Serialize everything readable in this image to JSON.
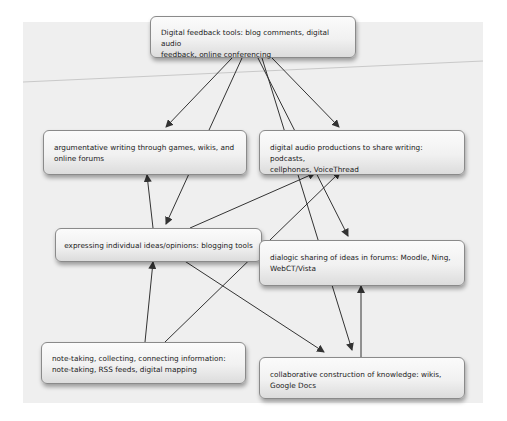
{
  "diagram": {
    "background_color": "#efefef",
    "node_border_color": "#8a8a8a",
    "edge_color": "#333333",
    "nodes": [
      {
        "id": "feedback",
        "label": "Digital feedback tools: blog comments, digital audio feedback, online conferencing",
        "line1": "Digital feedback tools: blog comments, digital audio",
        "line2": "feedback, online conferencing"
      },
      {
        "id": "argumentative",
        "label": "argumentative writing through games, wikis, and online forums",
        "line1": "argumentative writing through games, wikis, and",
        "line2": "online forums"
      },
      {
        "id": "audio",
        "label": "digital audio productions to share writing: podcasts, cellphones, VoiceThread",
        "line1": "digital audio productions to share writing: podcasts,",
        "line2": "cellphones, VoiceThread"
      },
      {
        "id": "blogging",
        "label": "expressing individual ideas/opinions: blogging tools",
        "line1": "expressing individual ideas/opinions: blogging tools"
      },
      {
        "id": "forums",
        "label": "dialogic sharing of ideas in forums: Moodle, Ning, WebCT/Vista",
        "line1": "dialogic sharing of ideas in forums: Moodle, Ning,",
        "line2": "WebCT/Vista"
      },
      {
        "id": "notetaking",
        "label": "note-taking, collecting, connecting information: note-taking, RSS feeds, digital mapping",
        "line1": "note-taking, collecting, connecting information:",
        "line2": "note-taking, RSS feeds, digital mapping"
      },
      {
        "id": "collaborative",
        "label": "collaborative construction of knowledge: wikis, Google Docs",
        "line1": "collaborative construction of knowledge: wikis,",
        "line2": "Google Docs"
      }
    ],
    "edges": [
      {
        "from": "feedback",
        "to": "argumentative",
        "arrow": true
      },
      {
        "from": "feedback",
        "to": "blogging",
        "arrow": true
      },
      {
        "from": "feedback",
        "to": "forums",
        "arrow": true
      },
      {
        "from": "feedback",
        "to": "collaborative",
        "arrow": true
      },
      {
        "from": "feedback",
        "to": "audio",
        "arrow": true
      },
      {
        "from": "blogging",
        "to": "argumentative",
        "arrow": true
      },
      {
        "from": "blogging",
        "to": "audio",
        "arrow": true
      },
      {
        "from": "blogging",
        "to": "collaborative",
        "arrow": true
      },
      {
        "from": "notetaking",
        "to": "blogging",
        "arrow": true
      },
      {
        "from": "notetaking",
        "to": "audio",
        "arrow": true
      },
      {
        "from": "collaborative",
        "to": "forums",
        "arrow": true
      }
    ]
  }
}
